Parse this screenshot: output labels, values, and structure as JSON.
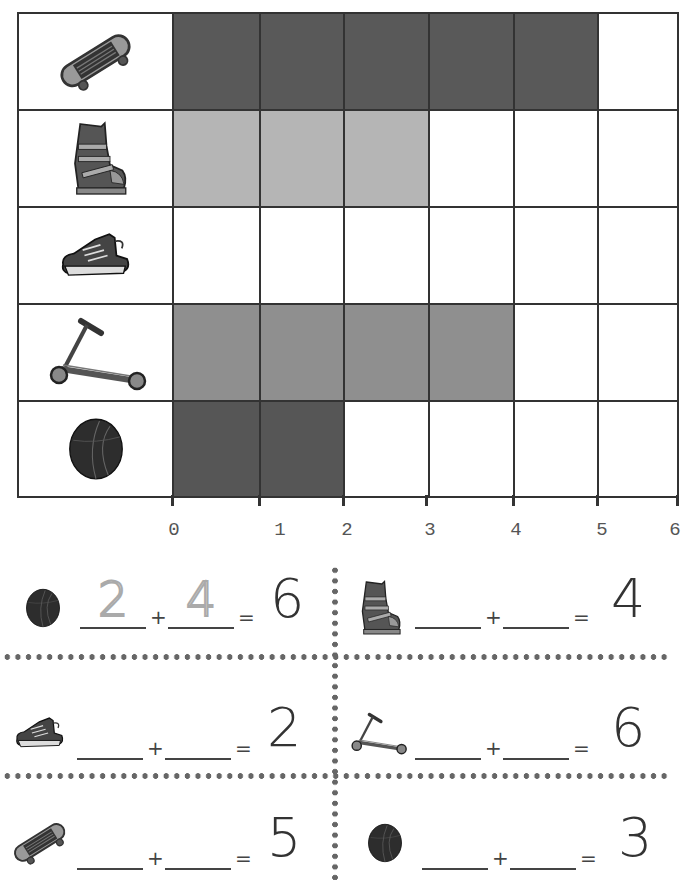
{
  "chart_data": {
    "type": "bar",
    "orientation": "horizontal",
    "title": "",
    "categories": [
      "skateboard",
      "ski boot",
      "sneaker",
      "scooter",
      "ball"
    ],
    "values": [
      5,
      3,
      0,
      4,
      2
    ],
    "xlabel": "",
    "ylabel": "",
    "xlim": [
      0,
      6
    ],
    "x_ticks": [
      "0",
      "1",
      "2",
      "3",
      "4",
      "5",
      "6"
    ],
    "grid": true,
    "legend": "none",
    "colors": [
      "#595959",
      "#b5b5b5",
      "#ffffff",
      "#8f8f8f",
      "#565656"
    ]
  },
  "rows": [
    {
      "icon": "skateboard-icon",
      "count": 5,
      "color": "#595959"
    },
    {
      "icon": "ski-boot-icon",
      "count": 3,
      "color": "#b5b5b5"
    },
    {
      "icon": "sneaker-icon",
      "count": 0,
      "color": "#ffffff"
    },
    {
      "icon": "scooter-icon",
      "count": 4,
      "color": "#8f8f8f"
    },
    {
      "icon": "ball-icon",
      "count": 2,
      "color": "#565656"
    }
  ],
  "axis": {
    "ticks": [
      "0",
      "1",
      "2",
      "3",
      "4",
      "5",
      "6"
    ]
  },
  "equations": [
    {
      "icon": "ball-icon",
      "addend1": "2",
      "addend2": "4",
      "plus": "+",
      "equals": "=",
      "total": "6"
    },
    {
      "icon": "ski-boot-icon",
      "addend1": "",
      "addend2": "",
      "plus": "+",
      "equals": "=",
      "total": "4"
    },
    {
      "icon": "sneaker-icon",
      "addend1": "",
      "addend2": "",
      "plus": "+",
      "equals": "=",
      "total": "2"
    },
    {
      "icon": "scooter-icon",
      "addend1": "",
      "addend2": "",
      "plus": "+",
      "equals": "=",
      "total": "6"
    },
    {
      "icon": "skateboard-icon",
      "addend1": "",
      "addend2": "",
      "plus": "+",
      "equals": "=",
      "total": "5"
    },
    {
      "icon": "ball-icon",
      "addend1": "",
      "addend2": "",
      "plus": "+",
      "equals": "=",
      "total": "3"
    }
  ]
}
